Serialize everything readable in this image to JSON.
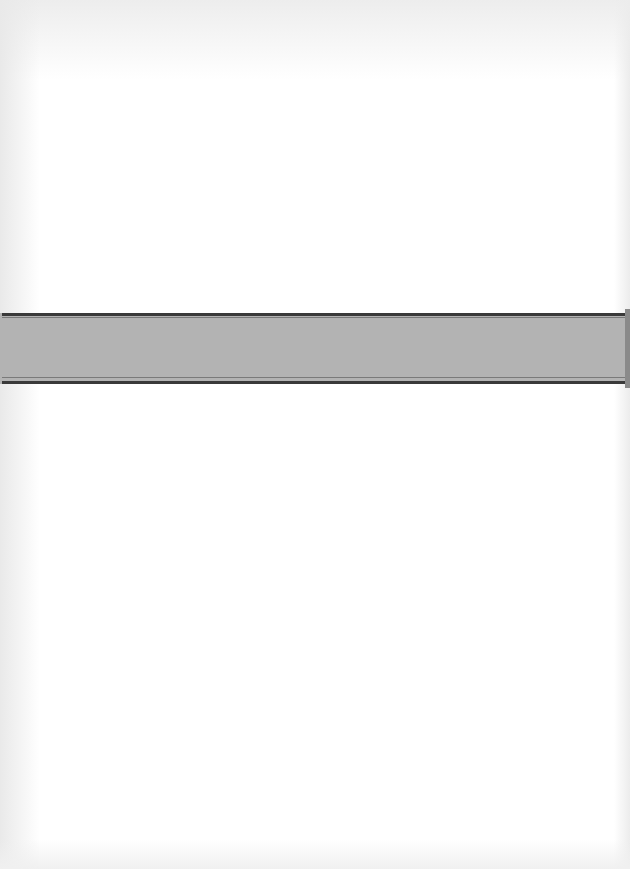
{
  "document": {
    "type": "scanned-blank-page",
    "background_color": "#ffffff",
    "band": {
      "color": "#b3b3b3",
      "rule_color": "#3a3a3a",
      "top_px": 313,
      "height_px": 71
    },
    "text": ""
  }
}
